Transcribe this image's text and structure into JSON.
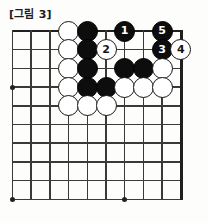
{
  "figure": {
    "caption": "[그림 3]",
    "kind": "go-board-diagram"
  },
  "board": {
    "origin_x": 12.5,
    "origin_y": 31,
    "spacing": 18.7,
    "cols": 10,
    "rows": 10,
    "line_color": "#3a3a3a",
    "edge_color": "#1f1f1f",
    "background": "#fdfdfb",
    "star_points": [
      {
        "col": 0,
        "row": 3
      },
      {
        "col": 0,
        "row": 9
      },
      {
        "col": 6,
        "row": 9
      }
    ]
  },
  "stones": [
    {
      "col": 3,
      "row": 0,
      "color": "white",
      "label": ""
    },
    {
      "col": 4,
      "row": 0,
      "color": "black",
      "label": ""
    },
    {
      "col": 6,
      "row": 0,
      "color": "black",
      "label": "1"
    },
    {
      "col": 8,
      "row": 0,
      "color": "black",
      "label": "5"
    },
    {
      "col": 3,
      "row": 1,
      "color": "white",
      "label": ""
    },
    {
      "col": 4,
      "row": 1,
      "color": "black",
      "label": ""
    },
    {
      "col": 5,
      "row": 1,
      "color": "white",
      "label": "2"
    },
    {
      "col": 8,
      "row": 1,
      "color": "black",
      "label": "3"
    },
    {
      "col": 9,
      "row": 1,
      "color": "white",
      "label": "4"
    },
    {
      "col": 3,
      "row": 2,
      "color": "white",
      "label": ""
    },
    {
      "col": 4,
      "row": 2,
      "color": "black",
      "label": ""
    },
    {
      "col": 6,
      "row": 2,
      "color": "black",
      "label": ""
    },
    {
      "col": 7,
      "row": 2,
      "color": "black",
      "label": ""
    },
    {
      "col": 8,
      "row": 2,
      "color": "white",
      "label": ""
    },
    {
      "col": 3,
      "row": 3,
      "color": "white",
      "label": ""
    },
    {
      "col": 4,
      "row": 3,
      "color": "black",
      "label": ""
    },
    {
      "col": 5,
      "row": 3,
      "color": "black",
      "label": ""
    },
    {
      "col": 6,
      "row": 3,
      "color": "white",
      "label": ""
    },
    {
      "col": 7,
      "row": 3,
      "color": "white",
      "label": ""
    },
    {
      "col": 8,
      "row": 3,
      "color": "white",
      "label": ""
    },
    {
      "col": 3,
      "row": 4,
      "color": "white",
      "label": ""
    },
    {
      "col": 4,
      "row": 4,
      "color": "white",
      "label": ""
    },
    {
      "col": 5,
      "row": 4,
      "color": "white",
      "label": ""
    }
  ],
  "move_sequence": [
    {
      "number": "1",
      "color": "black"
    },
    {
      "number": "2",
      "color": "white"
    },
    {
      "number": "3",
      "color": "black"
    },
    {
      "number": "4",
      "color": "white"
    },
    {
      "number": "5",
      "color": "black"
    }
  ]
}
